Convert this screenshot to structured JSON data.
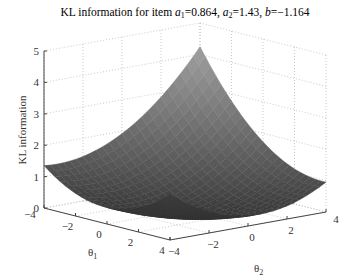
{
  "chart_data": {
    "type": "surface3d",
    "title": "KL information for item a1=0.864, a2=1.43, b=−1.164",
    "title_parts": {
      "prefix": "KL information for item ",
      "a1_label": "a",
      "a1_sub": "1",
      "a1_value": "=0.864, ",
      "a2_label": "a",
      "a2_sub": "2",
      "a2_value": "=1.43, ",
      "b_label": "b",
      "b_value": "=−1.164"
    },
    "xlabel": "θ1",
    "xlabel_parts": {
      "sym": "θ",
      "sub": "1"
    },
    "ylabel": "θ2",
    "ylabel_parts": {
      "sym": "θ",
      "sub": "2"
    },
    "zlabel": "KL information",
    "x_ticks": [
      "−4",
      "−2",
      "0",
      "2",
      "4"
    ],
    "y_ticks": [
      "−4",
      "−2",
      "0",
      "2",
      "4"
    ],
    "z_ticks": [
      "0",
      "1",
      "2",
      "3",
      "4",
      "5"
    ],
    "xlim": [
      -4,
      4
    ],
    "ylim": [
      -4,
      4
    ],
    "zlim": [
      0,
      5
    ],
    "grid": true,
    "colormap": "gray",
    "approx_surface_points": [
      {
        "theta1": -4,
        "theta2": -4,
        "kl": 3.0
      },
      {
        "theta1": 0,
        "theta2": 0,
        "kl": 0.2
      },
      {
        "theta1": 4,
        "theta2": 4,
        "kl": 0.3
      },
      {
        "theta1": -4,
        "theta2": 4,
        "kl": 4.6
      },
      {
        "theta1": 4,
        "theta2": -4,
        "kl": 0.0
      }
    ]
  }
}
